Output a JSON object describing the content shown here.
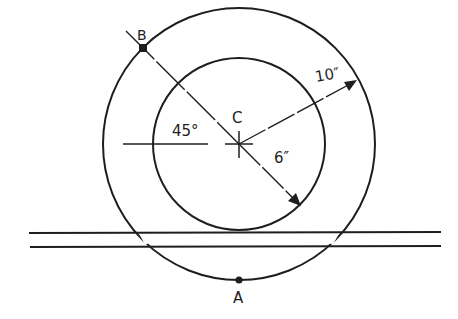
{
  "diagram": {
    "title": "",
    "colors": {
      "ink": "#1e1e1e",
      "background": "#ffffff"
    },
    "center": {
      "label": "C",
      "x": 239,
      "y": 144
    },
    "outer_circle": {
      "radius_label": "10″",
      "radius_value_in": 10,
      "r_px": 136
    },
    "inner_circle": {
      "radius_label": "6″",
      "radius_value_in": 6,
      "r_px": 86
    },
    "angle": {
      "label": "45°",
      "value_deg": 45
    },
    "points": [
      {
        "label": "A",
        "description": "lowest point of outer circle"
      },
      {
        "label": "B",
        "description": "point on outer circle at 45° above horizontal, upper-left"
      }
    ],
    "rails": {
      "count": 2,
      "description": "two parallel horizontal lines (track) tangent to inner circle"
    }
  }
}
